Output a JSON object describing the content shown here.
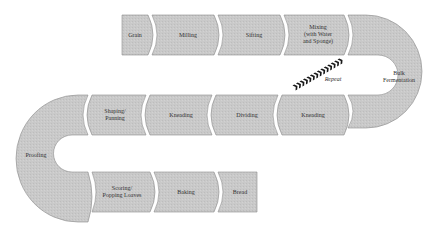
{
  "diagram": {
    "colors": {
      "segment_fill": "#c8c8c8",
      "segment_stroke": "#8a8a8a",
      "separator": "#ffffff",
      "text": "#333333",
      "repeat_arrow": "#1a1a1a",
      "background": "#ffffff"
    },
    "steps": [
      {
        "id": "grain",
        "label": "Grain",
        "row": "top"
      },
      {
        "id": "milling",
        "label": "Milling",
        "row": "top"
      },
      {
        "id": "sifting",
        "label": "Sifting",
        "row": "top"
      },
      {
        "id": "mixing",
        "label": "Mixing\n(with Water\nand Sponge)",
        "line1": "Mixing",
        "line2": "(with Water",
        "line3": "and Sponge)",
        "row": "top"
      },
      {
        "id": "bulk_fermentation",
        "label": "Bulk Fermentation",
        "line1": "Bulk",
        "line2": "Fermentation",
        "row": "right-turn"
      },
      {
        "id": "kneading_1",
        "label": "Kneading",
        "row": "middle"
      },
      {
        "id": "dividing",
        "label": "Dividing",
        "row": "middle"
      },
      {
        "id": "kneading_2",
        "label": "Kneading",
        "row": "middle"
      },
      {
        "id": "shaping",
        "label": "Shaping/ Panning",
        "line1": "Shaping/",
        "line2": "Panning",
        "row": "middle"
      },
      {
        "id": "proofing",
        "label": "Proofing",
        "row": "left-turn"
      },
      {
        "id": "scoring",
        "label": "Scoring/ Popping Loaves",
        "line1": "Scoring/",
        "line2": "Popping Loaves",
        "row": "bottom"
      },
      {
        "id": "baking",
        "label": "Baking",
        "row": "bottom"
      },
      {
        "id": "bread",
        "label": "Bread",
        "row": "bottom"
      }
    ],
    "repeat": {
      "label": "Repeat"
    }
  }
}
